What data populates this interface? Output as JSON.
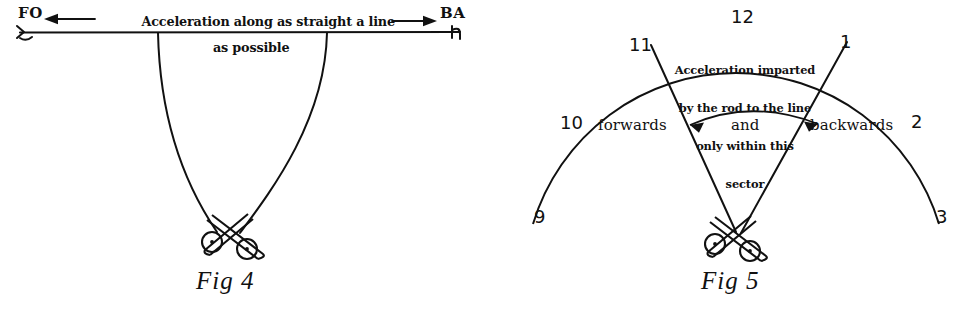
{
  "page": {
    "ink_color": "#111111",
    "background_color": "#ffffff"
  },
  "fig4": {
    "caption": "Fig 4",
    "axis_caption_line1": "Acceleration along as straight a line",
    "axis_caption_line2": "as possible",
    "left_label": "FO",
    "right_label": "BA",
    "left_arrow_icon": "left-arrow-icon",
    "right_arrow_icon": "right-arrow-icon",
    "rod_icon": "crossed-rods-icon"
  },
  "fig5": {
    "caption": "Fig 5",
    "sector_note_line1": "Acceleration imparted",
    "sector_note_line2": "by the rod to the line",
    "sector_note_line3": "only within this",
    "sector_note_line4": "sector",
    "direction_forwards": "forwards",
    "direction_and": "and",
    "direction_backwards": "backwards",
    "clock_numbers": [
      {
        "label": "12",
        "name": "clock-number-12"
      },
      {
        "label": "11",
        "name": "clock-number-11"
      },
      {
        "label": "1",
        "name": "clock-number-1"
      },
      {
        "label": "10",
        "name": "clock-number-10"
      },
      {
        "label": "2",
        "name": "clock-number-2"
      },
      {
        "label": "9",
        "name": "clock-number-9"
      },
      {
        "label": "3",
        "name": "clock-number-3"
      }
    ],
    "sector_arrow_icon": "double-headed-arc-arrow-icon",
    "rod_icon": "crossed-rods-icon"
  }
}
